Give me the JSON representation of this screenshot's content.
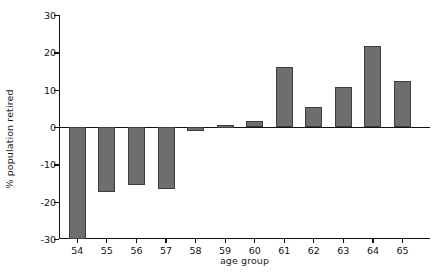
{
  "chart_data": {
    "type": "bar",
    "title": "",
    "xlabel": "age group",
    "ylabel": "% population retired",
    "categories": [
      "54",
      "55",
      "56",
      "57",
      "58",
      "59",
      "60",
      "61",
      "62",
      "63",
      "64",
      "65"
    ],
    "values": [
      -30.0,
      -17.5,
      -15.5,
      -16.5,
      -1.0,
      0.5,
      1.5,
      16.0,
      5.4,
      10.6,
      21.7,
      12.3
    ],
    "ylim": [
      -30,
      30
    ],
    "yticks": [
      30,
      20,
      10,
      0,
      -10,
      -20,
      -30
    ],
    "ytick_labels": [
      "30",
      "20",
      "10",
      "0",
      "-10",
      "-20",
      "-30"
    ],
    "grid": false,
    "legend": null,
    "bar_color": "#6e6e6e",
    "bar_edge_color": "#3d3d3d",
    "axis_color": "#111111",
    "background": "#ffffff"
  }
}
